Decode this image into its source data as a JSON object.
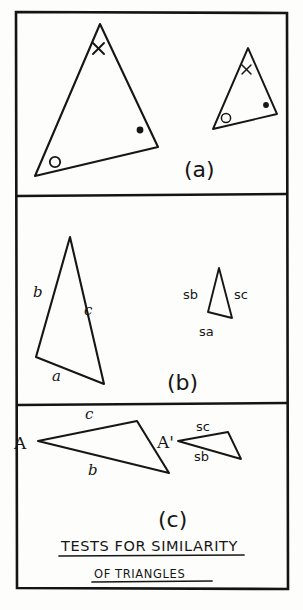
{
  "figure": {
    "title_line_1": "TESTS FOR SIMILARITY",
    "title_line_2": "OF TRIANGLES",
    "medium": "hand-drawn ink diagram",
    "ink_color": "#161616",
    "paper_color": "#fdfdfb"
  },
  "panels": [
    {
      "id": "a",
      "label": "(a)",
      "description": "Two triangles with matching angle marks (cross, open circle, filled dot)",
      "shapes": [
        {
          "name": "large-triangle",
          "vertices": [
            [
              100,
              24
            ],
            [
              157,
              146
            ],
            [
              35,
              176
            ]
          ],
          "angle_marks": [
            {
              "type": "x",
              "at": [
                98,
                49
              ]
            },
            {
              "type": "dot",
              "at": [
                140,
                130
              ]
            },
            {
              "type": "circle",
              "at": [
                55,
                163
              ]
            }
          ]
        },
        {
          "name": "small-triangle",
          "vertices": [
            [
              248,
              48
            ],
            [
              277,
              114
            ],
            [
              213,
              129
            ]
          ],
          "angle_marks": [
            {
              "type": "x",
              "at": [
                246,
                70
              ]
            },
            {
              "type": "dot",
              "at": [
                265,
                105
              ]
            },
            {
              "type": "circle",
              "at": [
                225,
                118
              ]
            }
          ]
        }
      ]
    },
    {
      "id": "b",
      "label": "(b)",
      "description": "Two triangles with proportional sides labelled a, b, c and sa, sb, sc",
      "shapes": [
        {
          "name": "large-triangle",
          "vertices": [
            [
              70,
              237
            ],
            [
              103,
              383
            ],
            [
              36,
              357
            ]
          ],
          "side_labels": [
            {
              "text": "b",
              "at": [
                38,
                292
              ]
            },
            {
              "text": "c",
              "at": [
                89,
                309
              ]
            },
            {
              "text": "a",
              "at": [
                57,
                374
              ]
            }
          ]
        },
        {
          "name": "small-triangle",
          "vertices": [
            [
              219,
              268
            ],
            [
              231,
              317
            ],
            [
              208,
              312
            ]
          ],
          "side_labels": [
            {
              "text": "sb",
              "at": [
                185,
                295
              ]
            },
            {
              "text": "sc",
              "at": [
                236,
                295
              ]
            },
            {
              "text": "sa",
              "at": [
                206,
                331
              ]
            }
          ]
        }
      ]
    },
    {
      "id": "c",
      "label": "(c)",
      "description": "Two triangles sharing equal angle A and A' with proportional adjacent sides",
      "shapes": [
        {
          "name": "large-triangle",
          "vertices": [
            [
              38,
              441
            ],
            [
              137,
              421
            ],
            [
              168,
              472
            ]
          ],
          "vertex_labels": [
            {
              "text": "A",
              "at": [
                18,
                447
              ]
            }
          ],
          "side_labels": [
            {
              "text": "c",
              "at": [
                88,
                417
              ]
            },
            {
              "text": "b",
              "at": [
                92,
                470
              ]
            }
          ]
        },
        {
          "name": "small-triangle",
          "vertices": [
            [
              178,
              441
            ],
            [
              227,
              432
            ],
            [
              240,
              458
            ]
          ],
          "vertex_labels": [
            {
              "text": "A'",
              "at": [
                160,
                446
              ]
            }
          ],
          "side_labels": [
            {
              "text": "sc",
              "at": [
                200,
                429
              ]
            },
            {
              "text": "sb",
              "at": [
                200,
                457
              ]
            }
          ]
        }
      ]
    }
  ],
  "frame": {
    "outer": {
      "x": 15,
      "y": 11,
      "width": 273,
      "height": 579
    },
    "dividers_y": [
      195,
      404
    ]
  }
}
